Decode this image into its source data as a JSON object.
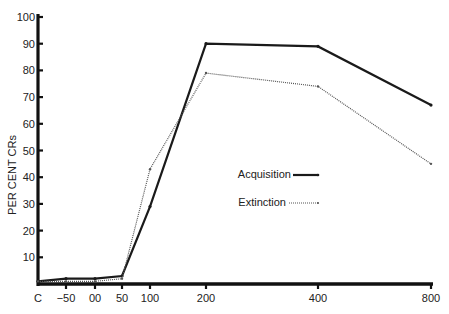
{
  "chart_data": {
    "type": "line",
    "title": "",
    "xlabel": "",
    "ylabel": "PER CENT CRs",
    "categories": [
      "C",
      "−50",
      "00",
      "50",
      "100",
      "200",
      "400",
      "800"
    ],
    "series": [
      {
        "name": "Acquisition",
        "style": "solid",
        "color": "#1a1a1a",
        "values": [
          1,
          2,
          2,
          3,
          29,
          90,
          89,
          67
        ]
      },
      {
        "name": "Extinction",
        "style": "dotted",
        "color": "#555555",
        "values": [
          1,
          1,
          1,
          2,
          43,
          79,
          74,
          45
        ]
      }
    ],
    "yticks": [
      10,
      20,
      30,
      40,
      50,
      60,
      70,
      80,
      90,
      100
    ],
    "ylim": [
      0,
      100
    ],
    "grid": false,
    "legend_position": "center-right inside plot"
  },
  "axis": {
    "ylabel": "PER CENT CRs"
  },
  "legend": {
    "items": [
      {
        "label": "Acquisition"
      },
      {
        "label": "Extinction"
      }
    ]
  }
}
